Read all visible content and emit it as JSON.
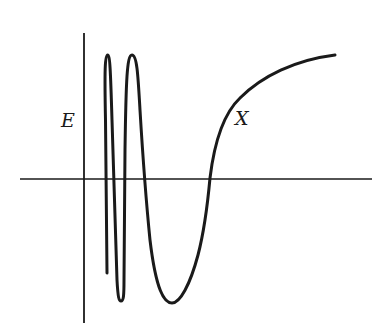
{
  "diagram": {
    "y_axis_label": "E",
    "curve_label": "X",
    "colors": {
      "ink": "#1a1a1a",
      "background": "#ffffff"
    }
  }
}
